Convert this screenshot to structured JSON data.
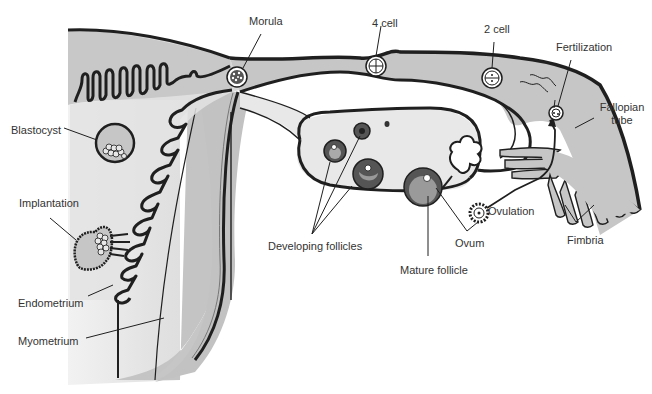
{
  "diagram": {
    "colors": {
      "background": "#ffffff",
      "uterus_fill": "#c8c8c8",
      "uterus_light": "#e4e4e4",
      "cavity_fill": "#dedede",
      "ovary_fill": "#e6e6e6",
      "tube_fill": "#c6c6c6",
      "follicle_ring": "#555555",
      "follicle_fill": "#9a9a9a",
      "outline": "#1f1f1f",
      "label_text": "#333333"
    },
    "labels": {
      "morula": "Morula",
      "four_cell": "4 cell",
      "two_cell": "2 cell",
      "fertilization": "Fertilization",
      "fallopian_tube_line1": "Fallopian",
      "fallopian_tube_line2": "tube",
      "blastocyst": "Blastocyst",
      "implantation": "Implantation",
      "endometrium": "Endometrium",
      "myometrium": "Myometrium",
      "developing_follicles": "Developing follicles",
      "mature_follicle": "Mature follicle",
      "ovum": "Ovum",
      "ovulation": "Ovulation",
      "fimbria": "Fimbria"
    }
  }
}
